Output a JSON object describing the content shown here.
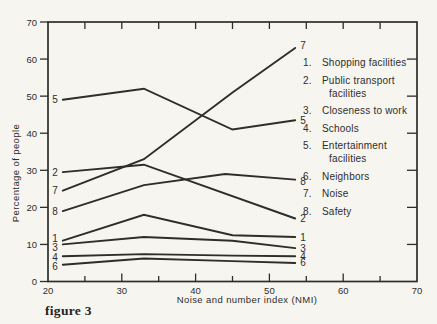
{
  "page": {
    "background": "#f7f5f0",
    "ink": "#2e2d2b"
  },
  "chart_data": {
    "type": "line",
    "title": "",
    "xlabel": "Noise and number index (NMI)",
    "ylabel": "Percentage of people",
    "caption": "figure 3",
    "xlim": [
      20,
      70
    ],
    "ylim": [
      0,
      70
    ],
    "x_major_ticks": [
      20,
      30,
      40,
      50,
      60,
      70
    ],
    "x_minor_ticks": [
      25,
      35,
      45,
      55,
      65
    ],
    "y_major_ticks": [
      0,
      10,
      20,
      30,
      40,
      50,
      60,
      70
    ],
    "right_ticks": [
      10,
      20,
      30,
      40,
      50,
      60
    ],
    "top_ticks": [
      25,
      30,
      35,
      40,
      45,
      50,
      55,
      60,
      65
    ],
    "grid": false,
    "legend_position": "inside-right",
    "series": [
      {
        "id": "1",
        "name": "Shopping facilities",
        "points": [
          [
            22,
            11
          ],
          [
            33,
            18
          ],
          [
            45,
            12.5
          ],
          [
            53.5,
            12
          ]
        ],
        "start_dy": -2,
        "end_dy": 0
      },
      {
        "id": "2",
        "name": "Public transport facilities",
        "points": [
          [
            22,
            29.5
          ],
          [
            33,
            31.5
          ],
          [
            53.5,
            17
          ]
        ],
        "start_dy": 0,
        "end_dy": 0
      },
      {
        "id": "3",
        "name": "Closeness to work",
        "points": [
          [
            22,
            10
          ],
          [
            33,
            12
          ],
          [
            45,
            11
          ],
          [
            53.5,
            9
          ]
        ],
        "start_dy": 3,
        "end_dy": 0
      },
      {
        "id": "4",
        "name": "Schools",
        "points": [
          [
            22,
            6.8
          ],
          [
            33,
            7.4
          ],
          [
            45,
            7
          ],
          [
            53.5,
            6.8
          ]
        ],
        "start_dy": 1,
        "end_dy": 0
      },
      {
        "id": "5",
        "name": "Entertainment facilities",
        "points": [
          [
            22,
            49
          ],
          [
            33,
            52
          ],
          [
            45,
            41
          ],
          [
            53.5,
            43.5
          ]
        ],
        "start_dy": 0,
        "end_dy": 0
      },
      {
        "id": "6",
        "name": "Neighbors",
        "points": [
          [
            22,
            4.5
          ],
          [
            33,
            6.2
          ],
          [
            45,
            5.5
          ],
          [
            53.5,
            5
          ]
        ],
        "start_dy": 2,
        "end_dy": 0
      },
      {
        "id": "7",
        "name": "Noise",
        "points": [
          [
            22,
            24.5
          ],
          [
            33,
            33
          ],
          [
            45,
            51
          ],
          [
            53.5,
            63
          ]
        ],
        "start_dy": 0,
        "end_dy": -2
      },
      {
        "id": "8",
        "name": "Safety",
        "points": [
          [
            22,
            19
          ],
          [
            33,
            26
          ],
          [
            44,
            29
          ],
          [
            53.5,
            27.5
          ]
        ],
        "start_dy": 0,
        "end_dy": 2
      }
    ]
  },
  "legend": {
    "items": [
      {
        "num": "1.",
        "lines": [
          "Shopping facilities"
        ]
      },
      {
        "num": "2.",
        "lines": [
          "Public transport",
          "facilities"
        ]
      },
      {
        "num": "3.",
        "lines": [
          "Closeness to work"
        ]
      },
      {
        "num": "4.",
        "lines": [
          "Schools"
        ]
      },
      {
        "num": "5.",
        "lines": [
          "Entertainment",
          "facilities"
        ]
      },
      {
        "num": "6.",
        "lines": [
          "Neighbors"
        ]
      },
      {
        "num": "7.",
        "lines": [
          "Noise"
        ]
      },
      {
        "num": "8.",
        "lines": [
          "Safety"
        ]
      }
    ]
  }
}
